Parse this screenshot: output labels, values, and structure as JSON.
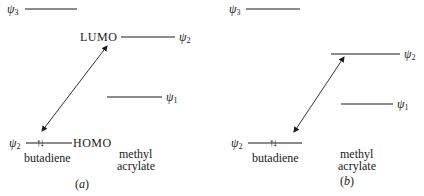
{
  "panels": [
    {
      "id": "a",
      "caption": "a",
      "levels": {
        "psi3": {
          "symbol": "ψ",
          "subscript": "3"
        },
        "lumo_psi2": {
          "symbol": "ψ",
          "subscript": "2",
          "tag": "LUMO"
        },
        "psi1": {
          "symbol": "ψ",
          "subscript": "1"
        },
        "homo_psi2": {
          "symbol": "ψ",
          "subscript": "2",
          "tag": "HOMO",
          "electrons": "↑↓"
        }
      },
      "molecule_left": "butadiene",
      "molecule_right_line1": "methyl",
      "molecule_right_line2": "acrylate"
    },
    {
      "id": "b",
      "caption": "b",
      "levels": {
        "psi3": {
          "symbol": "ψ",
          "subscript": "3"
        },
        "psi2": {
          "symbol": "ψ",
          "subscript": "2"
        },
        "psi1": {
          "symbol": "ψ",
          "subscript": "1"
        },
        "homo_psi2": {
          "symbol": "ψ",
          "subscript": "2",
          "electrons": "↑↓"
        }
      },
      "molecule_left": "butadiene",
      "molecule_right_line1": "methyl",
      "molecule_right_line2": "acrylate"
    }
  ],
  "colors": {
    "ink": "#1a1a1a",
    "background": "#ffffff"
  }
}
